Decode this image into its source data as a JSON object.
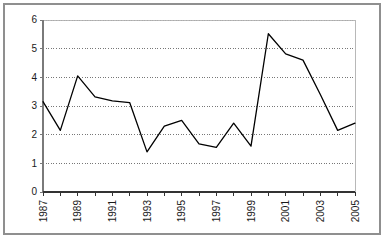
{
  "chart_data": {
    "type": "line",
    "title": "",
    "subtitle": "",
    "xlabel": "",
    "ylabel": "",
    "x": [
      1987,
      1988,
      1989,
      1990,
      1991,
      1992,
      1993,
      1994,
      1995,
      1996,
      1997,
      1998,
      1999,
      2000,
      2001,
      2002,
      2003,
      2004,
      2005
    ],
    "values": [
      3.15,
      2.15,
      4.05,
      3.32,
      3.18,
      3.12,
      1.4,
      2.3,
      2.5,
      1.68,
      1.56,
      2.4,
      1.6,
      5.52,
      4.82,
      4.6,
      3.4,
      2.15,
      2.4
    ],
    "series": [
      {
        "name": "",
        "values": [
          3.15,
          2.15,
          4.05,
          3.32,
          3.18,
          3.12,
          1.4,
          2.3,
          2.5,
          1.68,
          1.56,
          2.4,
          1.6,
          5.52,
          4.82,
          4.6,
          3.4,
          2.15,
          2.4
        ]
      }
    ],
    "xlim": [
      1987,
      2005
    ],
    "ylim": [
      0,
      6
    ],
    "ytick_labels": [
      "0",
      "1",
      "2",
      "3",
      "4",
      "5",
      "6"
    ],
    "ytick_values": [
      0,
      1,
      2,
      3,
      4,
      5,
      6
    ],
    "xtick_labels": [
      "1987",
      "1989",
      "1991",
      "1993",
      "1995",
      "1997",
      "1999",
      "2001",
      "2003",
      "2005"
    ],
    "xtick_values": [
      1987,
      1989,
      1991,
      1993,
      1995,
      1997,
      1999,
      2001,
      2003,
      2005
    ],
    "xtick_minor_values": [
      1988,
      1990,
      1992,
      1994,
      1996,
      1998,
      2000,
      2002,
      2004
    ],
    "xtick_label_rotation": 90,
    "grid": {
      "horizontal": true,
      "vertical": false,
      "style": "dotted",
      "color": "#555555"
    },
    "legend": {
      "visible": false,
      "position": "none",
      "entries": []
    },
    "line_color": "#000000",
    "line_width": 1.3,
    "markers": "none",
    "plot_border_color": "#b0b0b0",
    "axis_color": "#7a7a7a",
    "outer_border_color": "#8f8f8f",
    "background_color": "#ffffff"
  }
}
